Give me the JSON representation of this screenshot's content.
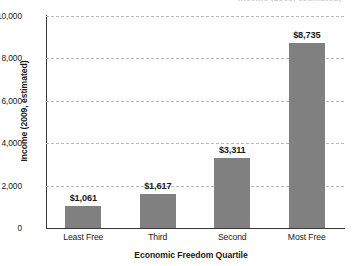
{
  "chart_data": {
    "type": "bar",
    "title": "Income (2009, estimated)",
    "xlabel": "Economic Freedom Quartile",
    "ylabel": "Income (2009, estimated)",
    "categories": [
      "Least Free",
      "Third",
      "Second",
      "Most Free"
    ],
    "values": [
      1061,
      1617,
      3311,
      8735
    ],
    "value_labels": [
      "$1,061",
      "$1,617",
      "$3,311",
      "$8,735"
    ],
    "ylim": [
      0,
      10000
    ],
    "ytick_values": [
      0,
      2000,
      4000,
      6000,
      8000,
      10000
    ],
    "ytick_labels": [
      "0",
      "2,000",
      "4,000",
      "6,000",
      "8,000",
      "10,000"
    ],
    "grid": "horizontal-dashed",
    "legend": "none",
    "bar_color": "#808080",
    "axis_color": "#3a3a3a",
    "gridline_color": "#b9b9b9"
  }
}
